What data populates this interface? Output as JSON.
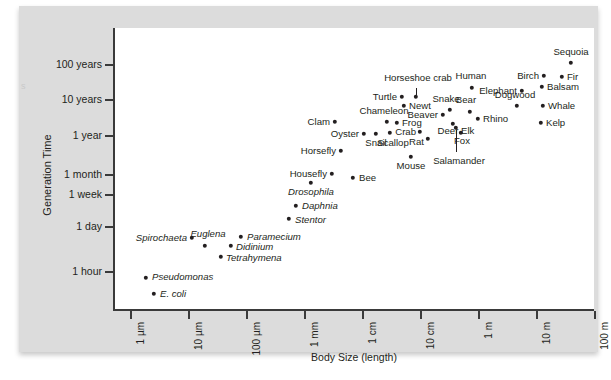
{
  "figure": {
    "edge_artifact": "s"
  },
  "chart_data": {
    "type": "scatter",
    "title": "",
    "xlabel": "Body Size (length)",
    "ylabel": "Generation Time",
    "grid": false,
    "legend": null,
    "x_axis": {
      "scale": "log",
      "tick_labels": [
        "1 µm",
        "10 µm",
        "100 µm",
        "1 mm",
        "1 cm",
        "10 cm",
        "1 m",
        "10 m",
        "100 m"
      ],
      "tick_values_m": [
        1e-06,
        1e-05,
        0.0001,
        0.001,
        0.01,
        0.1,
        1,
        10,
        100
      ]
    },
    "y_axis": {
      "scale": "log",
      "tick_labels": [
        "100 years",
        "10 years",
        "1 year",
        "1 month",
        "1 week",
        "1 day",
        "1 hour"
      ],
      "tick_values_hours": [
        876000,
        87600,
        8760,
        730,
        168,
        24,
        1
      ]
    },
    "points": [
      {
        "name": "E. coli",
        "italic": true,
        "x": 135,
        "y": 288,
        "label_pos": "right",
        "lx": 141,
        "ly": 288
      },
      {
        "name": "Pseudomonas",
        "italic": true,
        "x": 127,
        "y": 272,
        "label_pos": "right",
        "lx": 133,
        "ly": 271
      },
      {
        "name": "Spirochaeta",
        "italic": true,
        "x": 173,
        "y": 232,
        "label_pos": "left",
        "lx": 168,
        "ly": 232
      },
      {
        "name": "Euglena",
        "italic": true,
        "x": 186,
        "y": 240,
        "label_pos": "above",
        "lx": 189,
        "ly": 233
      },
      {
        "name": "Paramecium",
        "italic": true,
        "x": 222,
        "y": 231,
        "label_pos": "right",
        "lx": 228,
        "ly": 231
      },
      {
        "name": "Didinium",
        "italic": true,
        "x": 212,
        "y": 240,
        "label_pos": "right",
        "lx": 217,
        "ly": 241
      },
      {
        "name": "Tetrahymena",
        "italic": true,
        "x": 202,
        "y": 251,
        "label_pos": "right",
        "lx": 207,
        "ly": 252
      },
      {
        "name": "Stentor",
        "italic": true,
        "x": 270,
        "y": 213,
        "label_pos": "right",
        "lx": 276,
        "ly": 214
      },
      {
        "name": "Daphnia",
        "italic": true,
        "x": 277,
        "y": 200,
        "label_pos": "right",
        "lx": 283,
        "ly": 200
      },
      {
        "name": "Drosophila",
        "italic": true,
        "x": 292,
        "y": 177,
        "label_pos": "below",
        "lx": 292,
        "ly": 181
      },
      {
        "name": "Housefly",
        "italic": false,
        "x": 313,
        "y": 168,
        "label_pos": "left",
        "lx": 308,
        "ly": 168
      },
      {
        "name": "Bee",
        "italic": false,
        "x": 334,
        "y": 172,
        "label_pos": "right",
        "lx": 340,
        "ly": 172
      },
      {
        "name": "Horsefly",
        "italic": false,
        "x": 322,
        "y": 145,
        "label_pos": "left",
        "lx": 317,
        "ly": 145
      },
      {
        "name": "Clam",
        "italic": false,
        "x": 316,
        "y": 116,
        "label_pos": "left",
        "lx": 311,
        "ly": 116
      },
      {
        "name": "Oyster",
        "italic": false,
        "x": 345,
        "y": 128,
        "label_pos": "left",
        "lx": 340,
        "ly": 128
      },
      {
        "name": "Snail",
        "italic": false,
        "x": 357,
        "y": 128,
        "label_pos": "below",
        "lx": 357,
        "ly": 132
      },
      {
        "name": "Scallop",
        "italic": false,
        "x": 371,
        "y": 127,
        "label_pos": "below",
        "lx": 374,
        "ly": 132
      },
      {
        "name": "Chameleon",
        "italic": false,
        "x": 368,
        "y": 116,
        "label_pos": "above",
        "lx": 365,
        "ly": 110
      },
      {
        "name": "Frog",
        "italic": false,
        "x": 378,
        "y": 117,
        "label_pos": "right",
        "lx": 383,
        "ly": 117
      },
      {
        "name": "Newt",
        "italic": false,
        "x": 385,
        "y": 100,
        "label_pos": "right",
        "lx": 390,
        "ly": 100
      },
      {
        "name": "Turtle",
        "italic": false,
        "x": 383,
        "y": 91,
        "label_pos": "left",
        "lx": 378,
        "ly": 91
      },
      {
        "name": "Horseshoe crab",
        "italic": false,
        "x": 397,
        "y": 91,
        "label_pos": "above",
        "lx": 399,
        "ly": 77,
        "leader": {
          "x": 397,
          "y1": 82,
          "y2": 89
        }
      },
      {
        "name": "Crab",
        "italic": false,
        "x": 401,
        "y": 126,
        "label_pos": "left",
        "lx": 397,
        "ly": 126
      },
      {
        "name": "Rat",
        "italic": false,
        "x": 409,
        "y": 133,
        "label_pos": "left",
        "lx": 405,
        "ly": 136
      },
      {
        "name": "Mouse",
        "italic": false,
        "x": 392,
        "y": 151,
        "label_pos": "below",
        "lx": 392,
        "ly": 155
      },
      {
        "name": "Beaver",
        "italic": false,
        "x": 424,
        "y": 109,
        "label_pos": "left",
        "lx": 419,
        "ly": 109
      },
      {
        "name": "Snake",
        "italic": false,
        "x": 431,
        "y": 104,
        "label_pos": "above",
        "lx": 427,
        "ly": 98
      },
      {
        "name": "Deer Elk",
        "italic": false,
        "x": 434,
        "y": 118,
        "label_pos": "below",
        "lx": 437,
        "ly": 120
      },
      {
        "name": "Fox",
        "italic": false,
        "x": 442,
        "y": 127,
        "label_pos": "below",
        "lx": 443,
        "ly": 130
      },
      {
        "name": "Salamander",
        "italic": false,
        "x": 437,
        "y": 122,
        "label_pos": "below",
        "lx": 440,
        "ly": 150,
        "leader": {
          "x": 437,
          "y1": 124,
          "y2": 146
        }
      },
      {
        "name": "Bear",
        "italic": false,
        "x": 451,
        "y": 106,
        "label_pos": "above",
        "lx": 447,
        "ly": 99
      },
      {
        "name": "Rhino",
        "italic": false,
        "x": 459,
        "y": 113,
        "label_pos": "right",
        "lx": 464,
        "ly": 113
      },
      {
        "name": "Human",
        "italic": false,
        "x": 453,
        "y": 82,
        "label_pos": "above",
        "lx": 452,
        "ly": 75
      },
      {
        "name": "Elephant",
        "italic": false,
        "x": 503,
        "y": 85,
        "label_pos": "left",
        "lx": 498,
        "ly": 85
      },
      {
        "name": "Dogwood",
        "italic": false,
        "x": 498,
        "y": 100,
        "label_pos": "above",
        "lx": 496,
        "ly": 94
      },
      {
        "name": "Balsam",
        "italic": false,
        "x": 523,
        "y": 81,
        "label_pos": "right",
        "lx": 528,
        "ly": 81
      },
      {
        "name": "Birch",
        "italic": false,
        "x": 525,
        "y": 70,
        "label_pos": "left",
        "lx": 520,
        "ly": 70
      },
      {
        "name": "Fir",
        "italic": false,
        "x": 543,
        "y": 71,
        "label_pos": "right",
        "lx": 548,
        "ly": 71
      },
      {
        "name": "Sequoia",
        "italic": false,
        "x": 552,
        "y": 57,
        "label_pos": "above",
        "lx": 552,
        "ly": 51
      },
      {
        "name": "Whale",
        "italic": false,
        "x": 524,
        "y": 100,
        "label_pos": "right",
        "lx": 529,
        "ly": 100
      },
      {
        "name": "Kelp",
        "italic": false,
        "x": 522,
        "y": 117,
        "label_pos": "right",
        "lx": 527,
        "ly": 117
      }
    ]
  }
}
